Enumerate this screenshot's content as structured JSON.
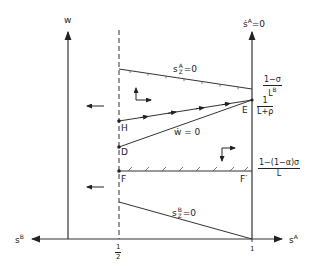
{
  "diagram": {
    "axes": {
      "w_axis_label": "w",
      "sA_dot_label": "ṡ",
      "sA_dot_sup": "A",
      "sA_dot_eq": "=0",
      "x_right_label": "s",
      "x_right_sup": "A",
      "x_left_label": "s",
      "x_left_sup": "B",
      "tick_half": "1/2",
      "tick_half_num": "1",
      "tick_half_den": "2",
      "tick_one": "1"
    },
    "curves": {
      "sAZ": {
        "base": "s",
        "sup": "A",
        "sub": "Z",
        "eq": "=0"
      },
      "sBZ": {
        "base": "s",
        "sup": "B",
        "sub": "Z",
        "eq": "=0"
      },
      "wdot": {
        "label": "ẇ = 0"
      }
    },
    "points": {
      "E": "E",
      "H": "H",
      "D": "D",
      "F": "F",
      "Fprime": "F′"
    },
    "right_labels": {
      "top": {
        "num": "1−σ",
        "den_base": "L",
        "den_sup": "B"
      },
      "mid": {
        "num": "1",
        "den": "L+ρ"
      },
      "low": {
        "num": "1−(1−α)σ",
        "den": "L"
      }
    }
  }
}
